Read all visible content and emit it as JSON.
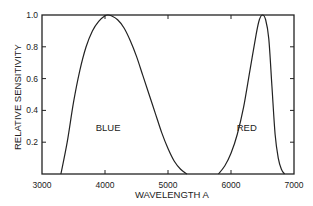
{
  "chart_data": {
    "type": "line",
    "title": "",
    "xlabel": "WAVELENGTH  A",
    "ylabel": "RELATIVE  SENSITIVITY",
    "xlim": [
      3000,
      7000
    ],
    "ylim": [
      0,
      1.0
    ],
    "grid": false,
    "legend": "none (inline labels)",
    "x_ticks": [
      3000,
      4000,
      5000,
      6000,
      7000
    ],
    "x_tick_labels": [
      "3000",
      "4000",
      "5000",
      "6000",
      "7000"
    ],
    "y_ticks": [
      0.2,
      0.4,
      0.6,
      0.8,
      1.0
    ],
    "y_tick_labels": [
      "0.2",
      "0.4",
      "0.6",
      "0.8",
      "1.0"
    ],
    "series": [
      {
        "name": "BLUE",
        "x": [
          3300,
          3400,
          3500,
          3600,
          3700,
          3800,
          3900,
          4000,
          4050,
          4100,
          4200,
          4300,
          4400,
          4500,
          4600,
          4700,
          4800,
          4900,
          5000,
          5100,
          5200,
          5300
        ],
        "values": [
          0.0,
          0.2,
          0.45,
          0.65,
          0.8,
          0.9,
          0.96,
          0.995,
          1.0,
          0.995,
          0.97,
          0.92,
          0.84,
          0.74,
          0.62,
          0.5,
          0.38,
          0.26,
          0.16,
          0.08,
          0.03,
          0.0
        ]
      },
      {
        "name": "RED",
        "x": [
          5800,
          5900,
          6000,
          6100,
          6200,
          6300,
          6400,
          6450,
          6500,
          6550,
          6600,
          6650,
          6700,
          6750,
          6800,
          6850
        ],
        "values": [
          0.0,
          0.05,
          0.13,
          0.25,
          0.42,
          0.65,
          0.88,
          0.97,
          1.0,
          0.97,
          0.85,
          0.55,
          0.25,
          0.1,
          0.03,
          0.0
        ]
      }
    ]
  }
}
